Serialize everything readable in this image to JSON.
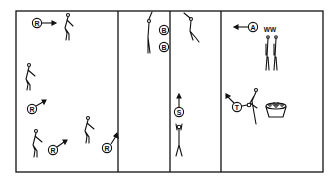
{
  "diagram": {
    "type": "gymnasium floor plan with stations",
    "frame": {
      "x": 16,
      "y": 11,
      "w": 307,
      "h": 161
    },
    "dividers_x": [
      118,
      170,
      221
    ],
    "colors": {
      "line": "#111111",
      "background": "#ffffff"
    },
    "markers": [
      {
        "label": "R",
        "x": 37,
        "y": 23,
        "arrow": "right"
      },
      {
        "label": "R",
        "x": 32,
        "y": 109,
        "arrow": "up-right"
      },
      {
        "label": "R",
        "x": 53,
        "y": 150,
        "arrow": "up-right"
      },
      {
        "label": "R",
        "x": 107,
        "y": 148,
        "arrow": "up-right"
      },
      {
        "label": "B",
        "x": 164,
        "y": 30,
        "arrow": "none"
      },
      {
        "label": "B",
        "x": 164,
        "y": 47,
        "arrow": "none"
      },
      {
        "label": "S",
        "x": 179,
        "y": 112,
        "arrow": "up"
      },
      {
        "label": "A",
        "x": 253,
        "y": 27,
        "arrow": "left"
      },
      {
        "label": "T",
        "x": 237,
        "y": 107,
        "arrow": "up-left"
      }
    ],
    "annotations": [
      {
        "text": "WW",
        "x": 270,
        "y": 29
      }
    ]
  }
}
